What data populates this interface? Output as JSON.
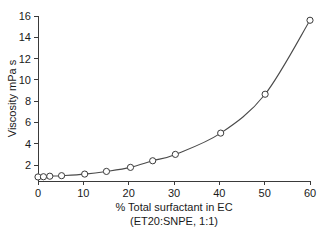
{
  "chart_data": {
    "type": "line",
    "title": "",
    "subtitle": "",
    "xlabel": "% Total surfactant in EC",
    "xlabel_line2": "(ET20:SNPE, 1:1)",
    "ylabel": "Viscosity mPa s",
    "xlim": [
      0,
      60
    ],
    "ylim": [
      0.5,
      16
    ],
    "grid": false,
    "legend": "none",
    "marker": "open-circle",
    "line_color": "#4a4a4a",
    "marker_edge_color": "#3a3a3a",
    "marker_face_color": "#ffffff",
    "background_color": "#ffffff",
    "xticks": [
      0,
      10,
      20,
      30,
      40,
      50,
      60
    ],
    "xtick_labels": [
      "0",
      "10",
      "20",
      "30",
      "40",
      "50",
      "60"
    ],
    "yticks": [
      2,
      4,
      6,
      8,
      10,
      12,
      14,
      16
    ],
    "ytick_labels": [
      "2",
      "4",
      "6",
      "8",
      "10",
      "12",
      "14",
      "16"
    ],
    "x": [
      0,
      1.2,
      2.6,
      5.2,
      10.3,
      15.1,
      20.4,
      25.3,
      30.3,
      40.3,
      50.1,
      60.0
    ],
    "y": [
      0.88,
      0.9,
      0.95,
      1.0,
      1.15,
      1.4,
      1.78,
      2.4,
      3.0,
      5.0,
      8.65,
      15.6
    ],
    "series": [
      {
        "name": "Viscosity",
        "values": [
          0.88,
          0.9,
          0.95,
          1.0,
          1.15,
          1.4,
          1.78,
          2.4,
          3.0,
          5.0,
          8.65,
          15.6
        ]
      }
    ],
    "points": [
      {
        "x": 0,
        "y": 0.88
      },
      {
        "x": 1.2,
        "y": 0.9
      },
      {
        "x": 2.6,
        "y": 0.95
      },
      {
        "x": 5.2,
        "y": 1.0
      },
      {
        "x": 10.3,
        "y": 1.15
      },
      {
        "x": 15.1,
        "y": 1.4
      },
      {
        "x": 20.4,
        "y": 1.78
      },
      {
        "x": 25.3,
        "y": 2.4
      },
      {
        "x": 30.3,
        "y": 3.0
      },
      {
        "x": 40.3,
        "y": 5.0
      },
      {
        "x": 50.1,
        "y": 8.65
      },
      {
        "x": 60.0,
        "y": 15.6
      }
    ]
  }
}
